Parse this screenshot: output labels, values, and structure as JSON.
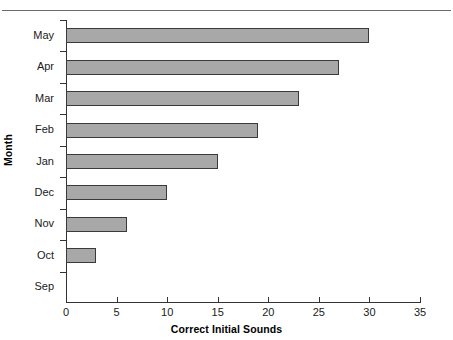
{
  "page": {
    "clipped_header_text": "",
    "rule_color": "#6b6b6b"
  },
  "chart_data": {
    "type": "bar",
    "orientation": "horizontal",
    "title": "",
    "xlabel": "Correct Initial Sounds",
    "ylabel": "Month",
    "categories": [
      "May",
      "Apr",
      "Mar",
      "Feb",
      "Jan",
      "Dec",
      "Nov",
      "Oct",
      "Sep"
    ],
    "values": [
      30,
      27,
      23,
      19,
      15,
      10,
      6,
      3,
      0
    ],
    "xlim": [
      0,
      35
    ],
    "xticks": [
      0,
      5,
      10,
      15,
      20,
      25,
      30,
      35
    ],
    "xtick_labels": [
      "0",
      "5",
      "10",
      "15",
      "20",
      "25",
      "30",
      "35"
    ],
    "grid": false,
    "legend": null,
    "bar_fill_color": "#a8a8a8",
    "bar_edge_color": "#3a3a3a",
    "axis_color": "#333333"
  }
}
